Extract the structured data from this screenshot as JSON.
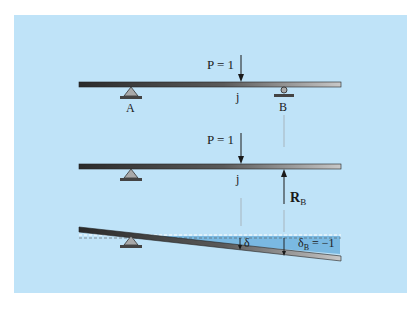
{
  "colors": {
    "background": "#bfe3f8",
    "beam_dark": "#2b2b2b",
    "beam_light": "#c8c8c8",
    "support_fill": "#a9a9a9",
    "deflection_fill": "#7ab9e2",
    "dashed_line": "#ffffff"
  },
  "diagram_1": {
    "load_label": "P = 1",
    "point_j_label": "j",
    "support_a_label": "A",
    "support_b_label": "B"
  },
  "diagram_2": {
    "load_label": "P = 1",
    "point_j_label": "j",
    "reaction_label": "R",
    "reaction_subscript": "B"
  },
  "diagram_3": {
    "deflection_j_label": "δ",
    "deflection_b_label": "δ",
    "deflection_b_subscript": "B",
    "deflection_b_value": " = −1"
  }
}
